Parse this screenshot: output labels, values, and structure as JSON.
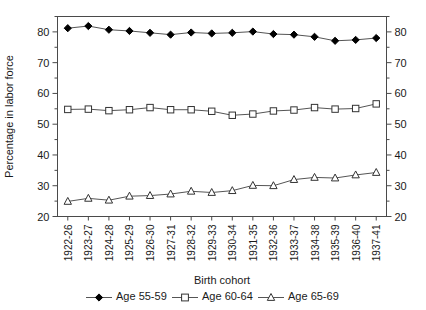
{
  "chart_data": {
    "type": "line",
    "title": "",
    "xlabel": "Birth cohort",
    "ylabel": "Percentage in labor force",
    "ylim": [
      20,
      85
    ],
    "y_ticks": [
      20,
      30,
      40,
      50,
      60,
      70,
      80
    ],
    "y_minor_step": 5,
    "grid": false,
    "legend_position": "bottom",
    "right_axis": true,
    "right_axis_ticks": [
      20,
      30,
      40,
      50,
      60,
      70,
      80
    ],
    "categories": [
      "1922-26",
      "1923-27",
      "1924-28",
      "1925-29",
      "1926-30",
      "1927-31",
      "1928-32",
      "1929-33",
      "1930-34",
      "1931-35",
      "1932-36",
      "1933-37",
      "1934-38",
      "1935-39",
      "1936-40",
      "1937-41"
    ],
    "series": [
      {
        "name": "Age 55-59",
        "marker": "diamond-filled",
        "values": [
          81.2,
          81.9,
          80.7,
          80.3,
          79.7,
          79.1,
          79.8,
          79.5,
          79.7,
          80.1,
          79.3,
          79.1,
          78.4,
          77.1,
          77.4,
          78.0
        ]
      },
      {
        "name": "Age 60-64",
        "marker": "square-open",
        "values": [
          54.8,
          54.9,
          54.4,
          54.7,
          55.4,
          54.7,
          54.7,
          54.2,
          52.9,
          53.3,
          54.3,
          54.6,
          55.4,
          54.9,
          55.1,
          56.6
        ]
      },
      {
        "name": "Age 65-69",
        "marker": "triangle-open",
        "values": [
          24.9,
          25.9,
          25.3,
          26.6,
          26.8,
          27.3,
          28.2,
          27.8,
          28.4,
          30.1,
          30.0,
          32.0,
          32.7,
          32.5,
          33.5,
          34.3
        ]
      }
    ]
  },
  "legend": {
    "items": [
      {
        "label": "Age 55-59",
        "marker": "diamond-filled"
      },
      {
        "label": "Age 60-64",
        "marker": "square-open"
      },
      {
        "label": "Age 65-69",
        "marker": "triangle-open"
      }
    ]
  },
  "colors": {
    "line": "#555555",
    "marker_fill_solid": "#000000",
    "marker_fill_open": "#ffffff",
    "marker_stroke": "#333333",
    "axis": "#4a4a4a",
    "text": "#1a1a1a",
    "background": "#ffffff"
  }
}
